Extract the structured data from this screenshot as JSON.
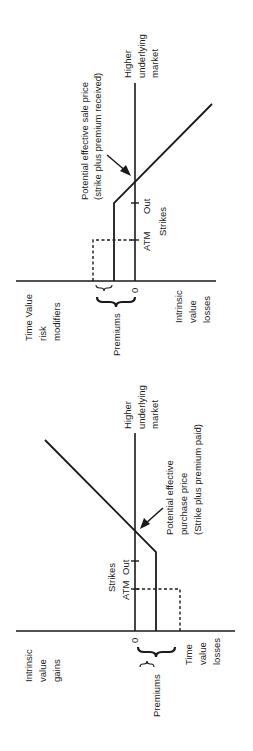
{
  "top_diagram": {
    "title": "Short/sale payoff",
    "labels": {
      "higher_1": "Higher",
      "higher_2": "underlying",
      "higher_3": "market",
      "sale_1": "Potential effective sale price",
      "sale_2": "(strike plus premium received)",
      "strikes": "Strikes",
      "atm": "ATM",
      "out": "Out",
      "zero": "0",
      "premiums": "Premiums",
      "tv_1": "Time Value",
      "tv_2": "risk",
      "tv_3": "modifiers",
      "iv_1": "Intrinsic",
      "iv_2": "value",
      "iv_3": "losses"
    }
  },
  "bottom_diagram": {
    "title": "Long/purchase payoff",
    "labels": {
      "higher_1": "Higher",
      "higher_2": "underlying",
      "higher_3": "market",
      "buy_1": "Potential effective",
      "buy_2": "purchase price",
      "buy_3": "(Strike plus premium paid)",
      "strikes": "Strikes",
      "atm": "ATM",
      "out": "Out",
      "zero": "0",
      "premiums": "Premiums",
      "ig_1": "Intrinsic",
      "ig_2": "value",
      "ig_3": "gains",
      "tv_1": "Time",
      "tv_2": "value",
      "tv_3": "losses"
    }
  },
  "colors": {
    "ink": "#1a1a1a",
    "background": "#ffffff"
  }
}
